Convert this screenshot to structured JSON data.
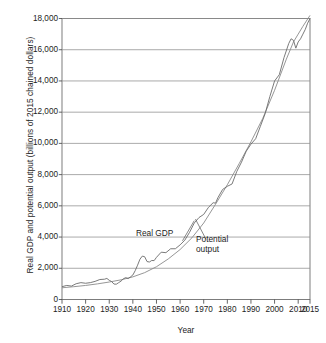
{
  "chart_data": {
    "type": "line",
    "title": "",
    "xlabel": "Year",
    "ylabel": "Real GDP and potential output (billions of 2015 chained dollars)",
    "xlim": [
      1910,
      2015
    ],
    "ylim": [
      0,
      18000
    ],
    "grid": "horizontal",
    "legend_position": "inline-annotations",
    "xticks": [
      "1910",
      "1920",
      "1930",
      "1940",
      "1950",
      "1960",
      "1970",
      "1980",
      "1990",
      "2000",
      "2010",
      "2015"
    ],
    "xtick_values": [
      1910,
      1920,
      1930,
      1940,
      1950,
      1960,
      1970,
      1980,
      1990,
      2000,
      2010,
      2015
    ],
    "yticks": [
      "0",
      "2,000",
      "4,000",
      "6,000",
      "8,000",
      "10,000",
      "12,000",
      "14,000",
      "16,000",
      "18,000"
    ],
    "ytick_values": [
      0,
      2000,
      4000,
      6000,
      8000,
      10000,
      12000,
      14000,
      16000,
      18000
    ],
    "annotations": [
      {
        "name": "real-gdp",
        "text": "Real GDP",
        "x": 1958,
        "y": 4050
      },
      {
        "name": "potential-output",
        "text": "Potential output",
        "x": 1972,
        "y": 3750
      }
    ],
    "series": [
      {
        "name": "Real GDP",
        "color": "#6b6b6b",
        "x": [
          1910,
          1912,
          1914,
          1916,
          1918,
          1920,
          1922,
          1924,
          1926,
          1928,
          1929,
          1930,
          1931,
          1932,
          1933,
          1934,
          1935,
          1936,
          1937,
          1938,
          1939,
          1940,
          1941,
          1942,
          1943,
          1944,
          1945,
          1946,
          1947,
          1948,
          1949,
          1950,
          1952,
          1954,
          1956,
          1958,
          1960,
          1962,
          1964,
          1966,
          1968,
          1970,
          1972,
          1974,
          1975,
          1976,
          1978,
          1980,
          1982,
          1984,
          1986,
          1988,
          1990,
          1992,
          1994,
          1996,
          1998,
          2000,
          2002,
          2004,
          2006,
          2007,
          2008,
          2009,
          2010,
          2011,
          2012,
          2013,
          2014,
          2015
        ],
        "y": [
          820,
          900,
          860,
          1010,
          1080,
          1040,
          1080,
          1160,
          1280,
          1300,
          1350,
          1230,
          1150,
          990,
          980,
          1080,
          1180,
          1330,
          1400,
          1340,
          1450,
          1570,
          1850,
          2200,
          2580,
          2780,
          2740,
          2430,
          2400,
          2500,
          2490,
          2700,
          3030,
          3000,
          3250,
          3250,
          3500,
          3800,
          4300,
          4900,
          5250,
          5450,
          5900,
          6200,
          6170,
          6520,
          7050,
          7250,
          7400,
          8200,
          8800,
          9500,
          9950,
          10300,
          11100,
          11900,
          13000,
          14000,
          14400,
          15500,
          16400,
          16700,
          16600,
          16100,
          16500,
          16700,
          17000,
          17300,
          17700,
          18000
        ]
      },
      {
        "name": "Potential output",
        "color": "#8a8a8a",
        "x": [
          1910,
          1915,
          1920,
          1925,
          1930,
          1935,
          1940,
          1945,
          1950,
          1955,
          1960,
          1965,
          1970,
          1975,
          1980,
          1985,
          1990,
          1995,
          2000,
          2005,
          2008,
          2010,
          2012,
          2015
        ],
        "y": [
          750,
          820,
          900,
          1000,
          1120,
          1260,
          1450,
          1720,
          2100,
          2600,
          3200,
          3950,
          4900,
          6100,
          7350,
          8700,
          10100,
          11600,
          13400,
          15400,
          16500,
          17000,
          17500,
          18200
        ]
      }
    ]
  }
}
